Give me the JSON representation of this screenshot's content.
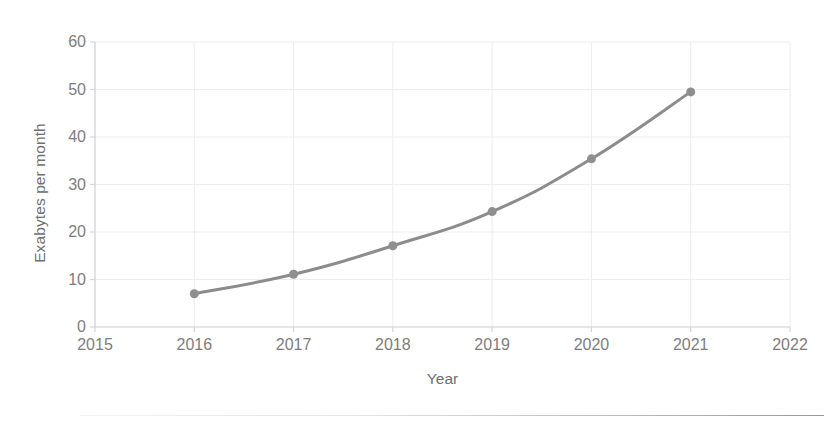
{
  "chart_data": {
    "type": "line",
    "title": "",
    "subtitle": "",
    "xlabel": "Year",
    "ylabel": "Exabytes per month",
    "x": [
      2016,
      2017,
      2018,
      2019,
      2020,
      2021
    ],
    "values": [
      7.0,
      11.1,
      17.1,
      24.3,
      35.4,
      49.5
    ],
    "series": [
      {
        "name": "Mobile data traffic",
        "values": [
          7.0,
          11.1,
          17.1,
          24.3,
          35.4,
          49.5
        ]
      }
    ],
    "xlim": [
      2015,
      2022
    ],
    "ylim": [
      0,
      60
    ],
    "x_tick_labels": [
      "2015",
      "2016",
      "2017",
      "2018",
      "2019",
      "2020",
      "2021",
      "2022"
    ],
    "y_tick_labels": [
      "0",
      "10",
      "20",
      "30",
      "40",
      "50",
      "60"
    ],
    "x_ticks": [
      2015,
      2016,
      2017,
      2018,
      2019,
      2020,
      2021,
      2022
    ],
    "y_ticks": [
      0,
      10,
      20,
      30,
      40,
      50,
      60
    ],
    "grid": true,
    "grid_axis": "both",
    "legend": false,
    "legend_position": "none",
    "marker": "circle",
    "marker_size": 9,
    "line_width": 3,
    "colors": {
      "line": "#8c8c8c",
      "marker": "#8f8f8f",
      "grid": "#ededed",
      "axis": "#d6d6d6",
      "tick_label": "#7d7d7d",
      "axis_title": "#6f6f6f",
      "background": "#ffffff"
    }
  }
}
